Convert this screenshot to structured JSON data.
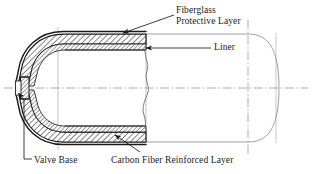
{
  "figure": {
    "type": "engineering-cross-section",
    "background": "#ffffff",
    "colors": {
      "outline": "#1a1a1a",
      "thin_line": "#6e6e6e",
      "centerline": "#8a8a8a",
      "hatch": "#2a2a2a",
      "text": "#1a1a1a"
    },
    "labels": [
      {
        "id": "fiberglass",
        "line1": "Fiberglass",
        "line2": "Protective Layer",
        "points_to": "outer protective shell surface"
      },
      {
        "id": "liner",
        "line1": "Liner",
        "line2": "",
        "points_to": "inner thin liner band"
      },
      {
        "id": "valve_base",
        "line1": "Valve Base",
        "line2": "",
        "points_to": "valve boss at left pole"
      },
      {
        "id": "carbon",
        "line1": "Carbon Fiber Reinforced Layer",
        "line2": "",
        "points_to": "thick hatched structural wall"
      }
    ],
    "layers": [
      {
        "name": "Fiberglass Protective Layer",
        "position": "outermost"
      },
      {
        "name": "Carbon Fiber Reinforced Layer",
        "position": "middle"
      },
      {
        "name": "Liner",
        "position": "innermost"
      }
    ],
    "components": [
      {
        "name": "Valve Base",
        "location": "left pole"
      }
    ],
    "centerlines": {
      "horizontal": 1,
      "vertical": 3,
      "style": "dash-dot"
    }
  }
}
